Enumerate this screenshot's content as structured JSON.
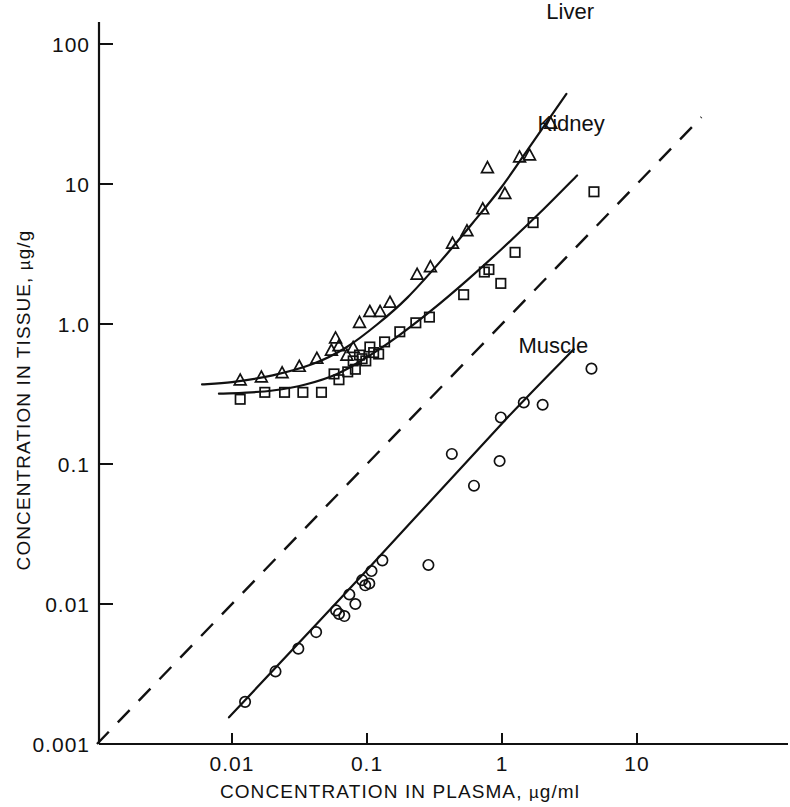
{
  "chart_data": {
    "type": "scatter",
    "title": "",
    "xlabel": "CONCENTRATION IN PLASMA, µg/ml",
    "ylabel": "CONCENTRATION IN TISSUE, µg/g",
    "xscale": "log",
    "yscale": "log",
    "xlim": [
      0.0025,
      35
    ],
    "ylim": [
      0.001,
      200
    ],
    "grid": false,
    "legend_position": "inline-curve-labels",
    "xticks": [
      {
        "value": 0.01,
        "label": "0.01"
      },
      {
        "value": 0.1,
        "label": "0.1"
      },
      {
        "value": 1,
        "label": "1"
      },
      {
        "value": 10,
        "label": "10"
      }
    ],
    "yticks": [
      {
        "value": 100,
        "label": "100"
      },
      {
        "value": 10,
        "label": "10"
      },
      {
        "value": 1,
        "label": "1.0"
      },
      {
        "value": 0.1,
        "label": "0.1"
      },
      {
        "value": 0.01,
        "label": "0.01"
      },
      {
        "value": 0.001,
        "label": "0.001"
      }
    ],
    "annotations": [
      {
        "text": "Liver",
        "x": 3.2,
        "y": 150.0
      },
      {
        "text": "Kidney",
        "x": 3.25,
        "y": 24.0
      },
      {
        "text": "Muscle",
        "x": 2.4,
        "y": 0.62
      }
    ],
    "reference_line": {
      "name": "unity-line",
      "style": "dashed",
      "label": "",
      "x": [
        0.001,
        30.0
      ],
      "y": [
        0.001,
        30.0
      ],
      "note": "line of identity, tissue = plasma"
    },
    "series": [
      {
        "name": "Liver",
        "marker": "triangle",
        "points": [
          {
            "x": 0.0115,
            "y": 0.395
          },
          {
            "x": 0.0165,
            "y": 0.415
          },
          {
            "x": 0.0235,
            "y": 0.445
          },
          {
            "x": 0.0315,
            "y": 0.495
          },
          {
            "x": 0.0425,
            "y": 0.565
          },
          {
            "x": 0.0545,
            "y": 0.645
          },
          {
            "x": 0.0585,
            "y": 0.79
          },
          {
            "x": 0.062,
            "y": 0.695
          },
          {
            "x": 0.071,
            "y": 0.595
          },
          {
            "x": 0.079,
            "y": 0.675
          },
          {
            "x": 0.088,
            "y": 1.02
          },
          {
            "x": 0.105,
            "y": 1.22
          },
          {
            "x": 0.125,
            "y": 1.22
          },
          {
            "x": 0.148,
            "y": 1.42
          },
          {
            "x": 0.235,
            "y": 2.25
          },
          {
            "x": 0.295,
            "y": 2.55
          },
          {
            "x": 0.43,
            "y": 3.75
          },
          {
            "x": 0.55,
            "y": 4.6
          },
          {
            "x": 0.72,
            "y": 6.6
          },
          {
            "x": 0.78,
            "y": 13.0
          },
          {
            "x": 1.05,
            "y": 8.5
          },
          {
            "x": 1.35,
            "y": 15.5
          },
          {
            "x": 1.6,
            "y": 16.0
          },
          {
            "x": 2.3,
            "y": 27.0
          }
        ],
        "fit_curve": {
          "x": [
            0.006,
            0.01,
            0.02,
            0.04,
            0.07,
            0.12,
            0.2,
            0.35,
            0.6,
            1.0,
            1.7,
            3.0
          ],
          "y": [
            0.37,
            0.385,
            0.43,
            0.52,
            0.68,
            1.0,
            1.55,
            2.8,
            5.2,
            9.6,
            20.0,
            44.0
          ]
        }
      },
      {
        "name": "Kidney",
        "marker": "square",
        "points": [
          {
            "x": 0.0115,
            "y": 0.29
          },
          {
            "x": 0.0175,
            "y": 0.325
          },
          {
            "x": 0.0245,
            "y": 0.325
          },
          {
            "x": 0.0335,
            "y": 0.325
          },
          {
            "x": 0.046,
            "y": 0.325
          },
          {
            "x": 0.057,
            "y": 0.44
          },
          {
            "x": 0.062,
            "y": 0.4
          },
          {
            "x": 0.072,
            "y": 0.455
          },
          {
            "x": 0.079,
            "y": 0.545
          },
          {
            "x": 0.082,
            "y": 0.475
          },
          {
            "x": 0.088,
            "y": 0.6
          },
          {
            "x": 0.092,
            "y": 0.565
          },
          {
            "x": 0.098,
            "y": 0.545
          },
          {
            "x": 0.105,
            "y": 0.685
          },
          {
            "x": 0.112,
            "y": 0.625
          },
          {
            "x": 0.122,
            "y": 0.61
          },
          {
            "x": 0.135,
            "y": 0.745
          },
          {
            "x": 0.175,
            "y": 0.88
          },
          {
            "x": 0.23,
            "y": 1.02
          },
          {
            "x": 0.29,
            "y": 1.12
          },
          {
            "x": 0.52,
            "y": 1.62
          },
          {
            "x": 0.74,
            "y": 2.35
          },
          {
            "x": 0.8,
            "y": 2.45
          },
          {
            "x": 0.98,
            "y": 1.95
          },
          {
            "x": 1.25,
            "y": 3.25
          },
          {
            "x": 1.7,
            "y": 5.3
          },
          {
            "x": 4.8,
            "y": 8.8
          }
        ],
        "fit_curve": {
          "x": [
            0.008,
            0.012,
            0.02,
            0.035,
            0.06,
            0.1,
            0.17,
            0.3,
            0.55,
            1.0,
            1.9,
            3.6
          ],
          "y": [
            0.318,
            0.322,
            0.335,
            0.37,
            0.44,
            0.58,
            0.82,
            1.25,
            2.05,
            3.45,
            6.2,
            11.5
          ]
        }
      },
      {
        "name": "Muscle",
        "marker": "circle",
        "points": [
          {
            "x": 0.0125,
            "y": 0.002
          },
          {
            "x": 0.021,
            "y": 0.0033
          },
          {
            "x": 0.031,
            "y": 0.0048
          },
          {
            "x": 0.042,
            "y": 0.0063
          },
          {
            "x": 0.059,
            "y": 0.009
          },
          {
            "x": 0.062,
            "y": 0.0085
          },
          {
            "x": 0.068,
            "y": 0.0082
          },
          {
            "x": 0.074,
            "y": 0.0117
          },
          {
            "x": 0.082,
            "y": 0.01
          },
          {
            "x": 0.092,
            "y": 0.0148
          },
          {
            "x": 0.097,
            "y": 0.0136
          },
          {
            "x": 0.104,
            "y": 0.014
          },
          {
            "x": 0.108,
            "y": 0.0172
          },
          {
            "x": 0.13,
            "y": 0.0205
          },
          {
            "x": 0.285,
            "y": 0.019
          },
          {
            "x": 0.425,
            "y": 0.118
          },
          {
            "x": 0.62,
            "y": 0.07
          },
          {
            "x": 0.96,
            "y": 0.105
          },
          {
            "x": 0.98,
            "y": 0.215
          },
          {
            "x": 1.45,
            "y": 0.275
          },
          {
            "x": 2.0,
            "y": 0.265
          },
          {
            "x": 4.6,
            "y": 0.48
          }
        ],
        "fit_curve": {
          "x": [
            0.0095,
            0.1,
            1.0,
            3.4
          ],
          "y": [
            0.00155,
            0.0175,
            0.195,
            0.66
          ]
        }
      }
    ]
  }
}
